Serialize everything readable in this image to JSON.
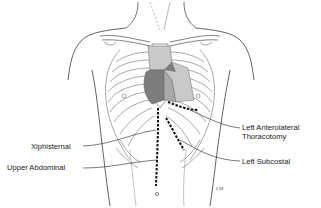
{
  "figure": {
    "colors": {
      "outline": "#3a3a3a",
      "rib": "#6e6e6e",
      "heart_light": "#c9c9c9",
      "heart_mid": "#a9a9a9",
      "heart_dark": "#7d7d7d",
      "incision": "#111111",
      "background": "#ffffff"
    },
    "signature": "LM"
  },
  "labels": {
    "left_anterolateral_line1": "Left Anterolateral",
    "left_anterolateral_line2": "Thoracotomy",
    "left_subcostal": "Left Subcostal",
    "xiphisternal": "Xiphisternal",
    "upper_abdominal": "Upper Abdominal"
  }
}
